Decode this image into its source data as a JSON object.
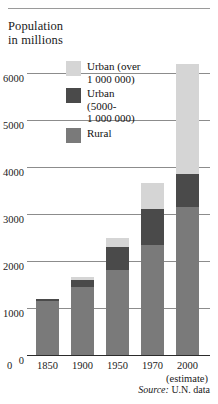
{
  "chart_data": {
    "type": "bar",
    "title": "Population\nin millions",
    "xlabel": "",
    "ylabel": "Population in millions",
    "categories": [
      "1850",
      "1900",
      "1950",
      "1970",
      "2000"
    ],
    "ylim": [
      0,
      6000
    ],
    "yticks": [
      "0",
      "1000",
      "2000",
      "3000",
      "4000",
      "5000",
      "6000"
    ],
    "ytick_values": [
      0,
      1000,
      2000,
      3000,
      4000,
      5000,
      6000
    ],
    "grid": true,
    "stacked": true,
    "legend_position": "inside-top-center",
    "series": [
      {
        "name": "Rural",
        "color": "#7a7a7a",
        "values": [
          1150,
          1450,
          1800,
          2350,
          3150
        ]
      },
      {
        "name": "Urban\n(5000-\n1 000 000)",
        "color": "#4a4a4a",
        "values": [
          50,
          150,
          500,
          750,
          700
        ]
      },
      {
        "name": "Urban (over\n1 000 000)",
        "color": "#d5d5d5",
        "values": [
          0,
          50,
          200,
          550,
          2350
        ]
      }
    ],
    "totals": [
      1200,
      1650,
      2500,
      3650,
      6200
    ],
    "annotations": {
      "estimate": "(estimate)",
      "source_label": "Source:",
      "source_value": "U.N. data"
    }
  },
  "legend": {
    "items": [
      {
        "label": "Urban (over\n1 000 000)",
        "color": "#d5d5d5"
      },
      {
        "label": "Urban\n(5000-\n1 000 000)",
        "color": "#4a4a4a"
      },
      {
        "label": "Rural",
        "color": "#7a7a7a"
      }
    ]
  },
  "axis": {
    "zero_label": "0"
  }
}
